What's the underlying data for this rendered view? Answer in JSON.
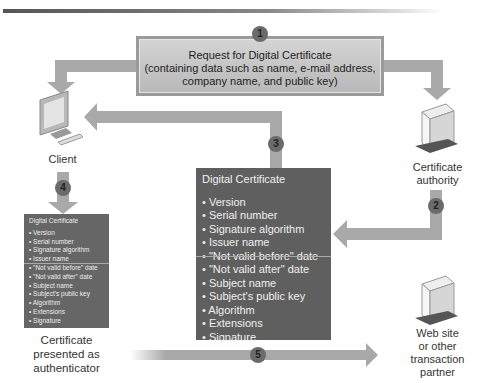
{
  "request": {
    "step": "1",
    "lines": [
      "Request for Digital Certificate",
      "(containing data such as name, e-mail address,",
      "company name, and public key)"
    ]
  },
  "nodes": {
    "client": "Client",
    "ca": [
      "Certificate",
      "authority"
    ],
    "partner": [
      "Web site",
      "or other",
      "transaction",
      "partner"
    ],
    "authenticator": [
      "Certificate",
      "presented as",
      "authenticator"
    ]
  },
  "steps": {
    "s2": "2",
    "s3": "3",
    "s4": "4",
    "s5": "5"
  },
  "certificate": {
    "title": "Digital Certificate",
    "fields": [
      "Version",
      "Serial number",
      "Signature algorithm",
      "Issuer name",
      "\"Not valid before\" date",
      "\"Not valid after\" date",
      "Subject name",
      "Subject's public key",
      "Algorithm",
      "Extensions",
      "Signature"
    ]
  },
  "colors": {
    "arrow": "#a9a9a9",
    "cert_bg": "#5f5f5f",
    "step_circle": "#6b6b6b"
  }
}
